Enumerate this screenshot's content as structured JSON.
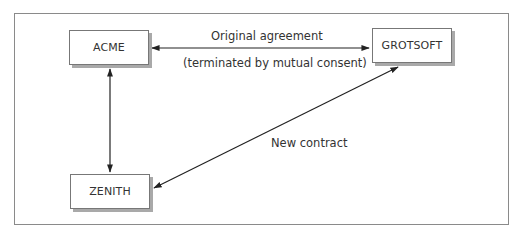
{
  "diagram": {
    "nodes": [
      {
        "id": "acme",
        "label": "ACME"
      },
      {
        "id": "grotsoft",
        "label": "GROTSOFT"
      },
      {
        "id": "zenith",
        "label": "ZENITH"
      }
    ],
    "edges": [
      {
        "from": "acme",
        "to": "grotsoft",
        "direction": "bidirectional",
        "label": "Original agreement",
        "sublabel": "(terminated by mutual consent)"
      },
      {
        "from": "acme",
        "to": "zenith",
        "direction": "bidirectional",
        "label": ""
      },
      {
        "from": "zenith",
        "to": "grotsoft",
        "direction": "bidirectional",
        "label": "New contract"
      }
    ]
  },
  "colors": {
    "frame": "#8a8a8a",
    "box_border": "#777777",
    "box_shadow": "#a9a9a9",
    "arrow": "#222222",
    "text": "#333333"
  }
}
